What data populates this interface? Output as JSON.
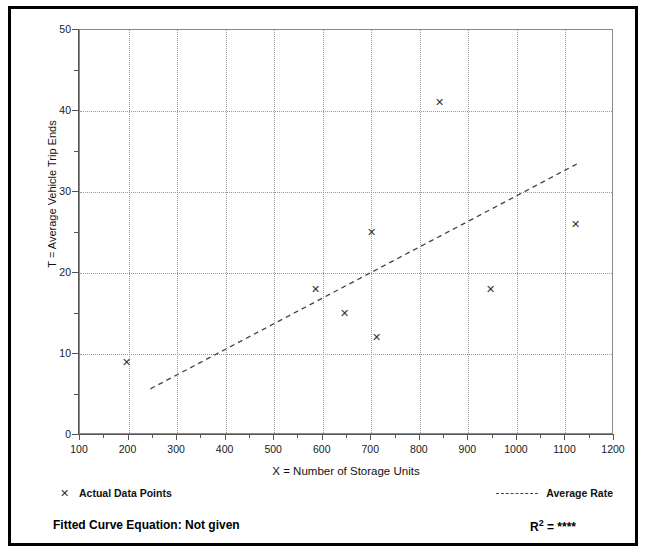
{
  "chart_data": {
    "type": "scatter",
    "title": "",
    "xlabel": "X = Number of Storage Units",
    "ylabel": "T = Average Vehicle Trip Ends",
    "xlim": [
      100,
      1200
    ],
    "ylim": [
      0,
      50
    ],
    "xticks": [
      100,
      200,
      300,
      400,
      500,
      600,
      700,
      800,
      900,
      1000,
      1100,
      1200
    ],
    "yticks": [
      0,
      10,
      20,
      30,
      40,
      50
    ],
    "x_minor_tick_step": 50,
    "y_minor_tick_step": 5,
    "grid": true,
    "grid_style": "dotted",
    "legend_position": "below-plot",
    "series": [
      {
        "name": "Actual Data Points",
        "marker": "x",
        "type": "scatter",
        "points": [
          {
            "x": 195,
            "y": 9
          },
          {
            "x": 585,
            "y": 18
          },
          {
            "x": 645,
            "y": 15
          },
          {
            "x": 700,
            "y": 25
          },
          {
            "x": 710,
            "y": 12
          },
          {
            "x": 840,
            "y": 41
          },
          {
            "x": 945,
            "y": 18
          },
          {
            "x": 1120,
            "y": 26
          }
        ]
      },
      {
        "name": "Average Rate",
        "type": "line",
        "style": "dashed",
        "endpoints": [
          {
            "x": 245,
            "y": 5.7
          },
          {
            "x": 1128,
            "y": 33.6
          }
        ]
      }
    ],
    "annotations": {
      "fitted_curve_label": "Fitted Curve Equation:",
      "fitted_curve_value": "Not given",
      "r_squared_label": "R",
      "r_squared_exponent": "2",
      "r_squared_equals": "=",
      "r_squared_value": "****"
    }
  },
  "axes": {
    "y_tick_labels": [
      "50",
      "40",
      "30",
      "20",
      "10",
      "0"
    ],
    "x_tick_labels": [
      "100",
      "200",
      "300",
      "400",
      "500",
      "600",
      "700",
      "800",
      "900",
      "1000",
      "1100",
      "1200"
    ],
    "y_title": "T = Average Vehicle Trip Ends",
    "x_title": "X = Number of Storage Units"
  },
  "legend": {
    "data_points_marker": "✕",
    "data_points_label": "Actual Data Points",
    "average_rate_label": "Average Rate"
  },
  "footer": {
    "fitted_curve_text": "Fitted Curve Equation:  Not given",
    "r_squared_base": "R",
    "r_squared_sup": "2",
    "r_squared_rest": " = ****"
  },
  "colors": {
    "frame": "#000000",
    "axis": "#555555",
    "grid": "#9a9a9a",
    "marker": "#333333",
    "trendline": "#444444",
    "background": "#ffffff"
  }
}
